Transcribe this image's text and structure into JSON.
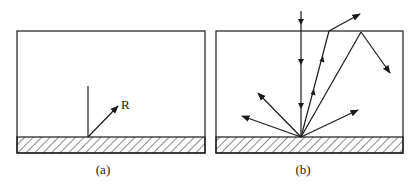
{
  "panels": [
    {
      "id": "a",
      "caption": "(a)",
      "box": {
        "x": 17,
        "y": 31,
        "w": 188,
        "h": 122
      },
      "ground_top": 137,
      "label_R": "R"
    },
    {
      "id": "b",
      "caption": "(b)",
      "box": {
        "x": 216,
        "y": 31,
        "w": 187,
        "h": 122
      },
      "ground_top": 137
    }
  ],
  "colors": {
    "stroke": "#1a1a1a",
    "background": "#ffffff"
  }
}
